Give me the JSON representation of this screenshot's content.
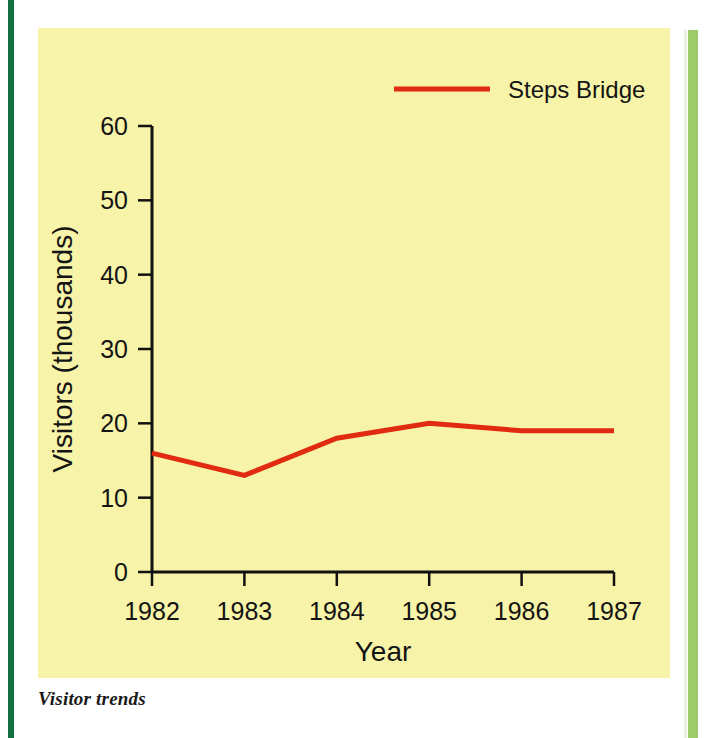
{
  "caption": "Visitor trends",
  "colors": {
    "panel_background": "#f7f3a8",
    "series_red": "#e02b10",
    "axis_black": "#111111",
    "left_rule_green": "#12713f",
    "right_rule_green": "#9ccb6a"
  },
  "chart_data": {
    "type": "line",
    "title": "",
    "subtitle": "",
    "xlabel": "Year",
    "ylabel": "Visitors (thousands)",
    "categories": [
      "1982",
      "1983",
      "1984",
      "1985",
      "1986",
      "1987"
    ],
    "x": [
      1982,
      1983,
      1984,
      1985,
      1986,
      1987
    ],
    "xlim": [
      1982,
      1987
    ],
    "ylim": [
      0,
      60
    ],
    "yticks": [
      0,
      10,
      20,
      30,
      40,
      50,
      60
    ],
    "ytick_labels": [
      "0",
      "10",
      "20",
      "30",
      "40",
      "50",
      "60"
    ],
    "xtick_labels": [
      "1982",
      "1983",
      "1984",
      "1985",
      "1986",
      "1987"
    ],
    "grid": false,
    "legend_position": "top-right",
    "series": [
      {
        "name": "Steps Bridge",
        "color": "#e02b10",
        "values": [
          16,
          13,
          18,
          20,
          19,
          19
        ]
      }
    ]
  },
  "legend": {
    "entries": [
      {
        "label": "Steps Bridge",
        "color": "#e02b10"
      }
    ]
  }
}
